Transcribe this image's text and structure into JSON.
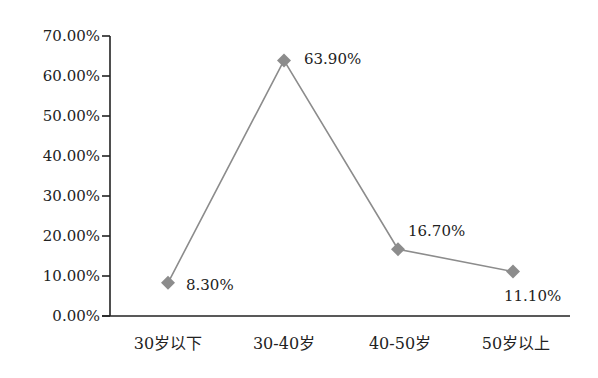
{
  "chart_data": {
    "type": "line",
    "title": "",
    "xlabel": "",
    "ylabel": "",
    "categories": [
      "30岁以下",
      "30-40岁",
      "40-50岁",
      "50岁以上"
    ],
    "series": [
      {
        "name": "",
        "values": [
          8.3,
          63.9,
          16.7,
          11.1
        ],
        "color": "#8c8c8c",
        "marker": "diamond"
      }
    ],
    "data_labels": [
      "8.30%",
      "63.90%",
      "16.70%",
      "11.10%"
    ],
    "y_ticks": [
      "0.00%",
      "10.00%",
      "20.00%",
      "30.00%",
      "40.00%",
      "50.00%",
      "60.00%",
      "70.00%"
    ],
    "ylim": [
      0,
      70
    ],
    "grid": false,
    "legend": "none"
  }
}
